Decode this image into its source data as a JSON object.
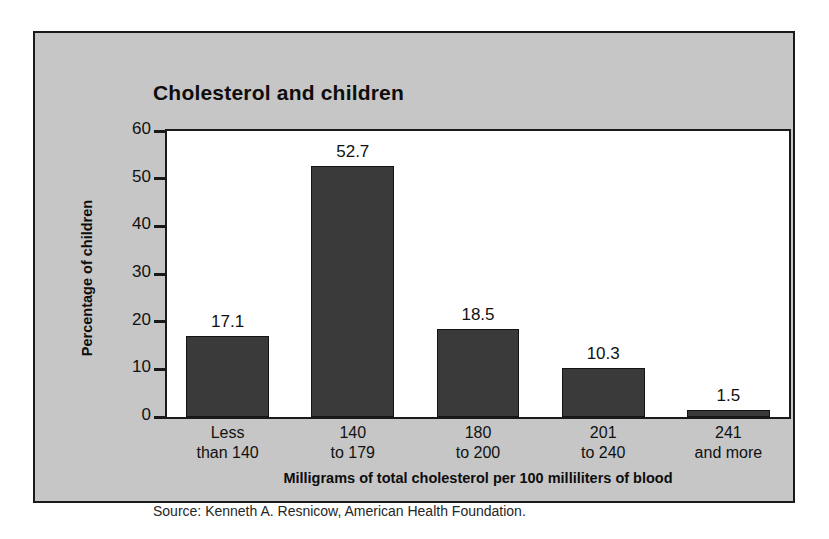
{
  "chart_data": {
    "type": "bar",
    "title": "Cholesterol and children",
    "categories": [
      "Less than 140",
      "140 to 179",
      "180 to 200",
      "201 to 240",
      "241 and more"
    ],
    "category_lines": [
      [
        "Less",
        "than 140"
      ],
      [
        "140",
        "to 179"
      ],
      [
        "180",
        "to 200"
      ],
      [
        "201",
        "to 240"
      ],
      [
        "241",
        "and more"
      ]
    ],
    "values": [
      17.1,
      52.7,
      18.5,
      10.3,
      1.5
    ],
    "value_labels": [
      "17.1",
      "52.7",
      "18.5",
      "10.3",
      "1.5"
    ],
    "xlabel": "Milligrams of total cholesterol per 100 milliliters of blood",
    "ylabel": "Percentage of children",
    "ylim": [
      0,
      60
    ],
    "yticks": [
      0,
      10,
      20,
      30,
      40,
      50,
      60
    ],
    "ytick_labels": [
      "0",
      "10",
      "20",
      "30",
      "40",
      "50",
      "60"
    ],
    "grid": false,
    "legend": false,
    "legend_position": "none",
    "bar_color": "#3a3a3a",
    "panel_background": "#c6c6c6",
    "plot_background": "#ffffff",
    "axis_color": "#1a1a1a"
  },
  "source": {
    "text": "Source: Kenneth A. Resnicow, American Health Foundation."
  }
}
